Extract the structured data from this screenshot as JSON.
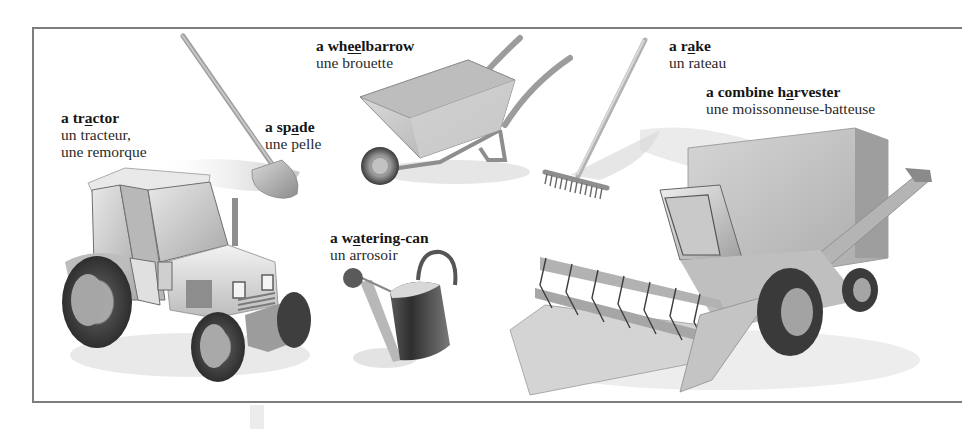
{
  "page": {
    "type": "vocabulary-illustration",
    "colors": {
      "frame": "#7d7d7d",
      "text": "#1a1a1a",
      "background": "#ffffff"
    }
  },
  "items": [
    {
      "id": "tractor",
      "en_pre": "a tr",
      "en_ul": "a",
      "en_post": "ctor",
      "fr": [
        "un tracteur,",
        "une remorque"
      ]
    },
    {
      "id": "spade",
      "en_pre": "a sp",
      "en_ul": "a",
      "en_post": "de",
      "fr": [
        "une pelle"
      ]
    },
    {
      "id": "wheelbarrow",
      "en_pre": "a wh",
      "en_ul": "ee",
      "en_post": "lbarrow",
      "fr": [
        "une brouette"
      ]
    },
    {
      "id": "rake",
      "en_pre": "a r",
      "en_ul": "a",
      "en_post": "ke",
      "fr": [
        "un rateau"
      ]
    },
    {
      "id": "combine",
      "en_pre": "a combine h",
      "en_ul": "a",
      "en_post": "rvester",
      "fr": [
        "une moissonneuse-batteuse"
      ]
    },
    {
      "id": "watering_can",
      "en_pre": "a w",
      "en_ul": "a",
      "en_post": "tering-can",
      "fr": [
        "un arrosoir"
      ]
    }
  ]
}
